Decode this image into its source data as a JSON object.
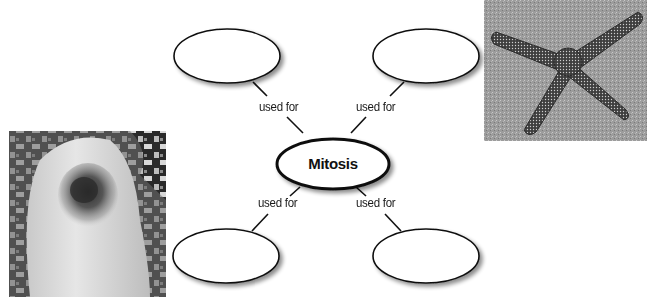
{
  "concept_map": {
    "center": {
      "label": "Mitosis"
    },
    "branches": [
      {
        "position": "top-left",
        "connector_label": "used for",
        "node_text": ""
      },
      {
        "position": "top-right",
        "connector_label": "used for",
        "node_text": ""
      },
      {
        "position": "bottom-left",
        "connector_label": "used for",
        "node_text": ""
      },
      {
        "position": "bottom-right",
        "connector_label": "used for",
        "node_text": ""
      }
    ]
  },
  "images": {
    "starfish": {
      "description": "Photo of a starfish on sand"
    },
    "knee": {
      "description": "Photo of a scraped knee"
    }
  },
  "colors": {
    "stroke": "#111111",
    "shadow": "#9a9a9a",
    "background": "#ffffff"
  }
}
